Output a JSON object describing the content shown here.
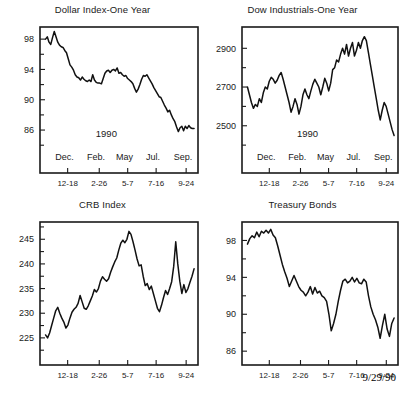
{
  "footer": {
    "date": "9/29/90"
  },
  "panels": [
    {
      "id": "dollar-index",
      "title": "Dollar Index-One Year",
      "year_label": "1990"
    },
    {
      "id": "dow-industrials",
      "title": "Dow Industrials-One Year",
      "year_label": "1990"
    },
    {
      "id": "crb-index",
      "title": "CRB Index",
      "year_label": ""
    },
    {
      "id": "treasury-bonds",
      "title": "Treasury Bonds",
      "year_label": ""
    }
  ],
  "chart_data": [
    {
      "type": "line",
      "id": "dollar-index",
      "title": "Dollar Index-One Year",
      "xlabel": "",
      "ylabel": "",
      "annotation": "1990",
      "grid": false,
      "legend": null,
      "ylim": [
        83.5,
        99.6
      ],
      "yticks": [
        86,
        90,
        94,
        98
      ],
      "yticks_minor": [
        84,
        88,
        92,
        96
      ],
      "ytick_labels": [
        "86",
        "90",
        "94",
        "98"
      ],
      "xtick_labels": [
        "12-18",
        "2-26",
        "5-7",
        "7-16",
        "9-24"
      ],
      "xtick_positions": [
        0.175,
        0.375,
        0.555,
        0.735,
        0.925
      ],
      "month_labels": [
        "Dec.",
        "Feb.",
        "May",
        "Jul.",
        "Sep."
      ],
      "month_positions": [
        0.155,
        0.355,
        0.535,
        0.715,
        0.905
      ],
      "values": [
        98.0,
        98.3,
        97.6,
        97.3,
        98.2,
        99.0,
        98.3,
        97.6,
        97.2,
        97.0,
        96.9,
        96.5,
        96.2,
        95.4,
        94.6,
        94.3,
        93.9,
        93.3,
        93.0,
        92.9,
        92.6,
        93.0,
        92.7,
        92.5,
        92.4,
        92.6,
        92.4,
        93.3,
        92.6,
        92.3,
        92.2,
        92.2,
        92.1,
        92.8,
        93.5,
        93.8,
        93.9,
        93.6,
        93.9,
        94.0,
        93.8,
        94.2,
        93.5,
        93.6,
        93.3,
        93.1,
        93.2,
        92.8,
        92.6,
        92.4,
        92.1,
        91.5,
        91.0,
        91.4,
        92.0,
        92.7,
        93.2,
        93.1,
        93.3,
        92.9,
        92.5,
        92.1,
        91.6,
        91.2,
        90.8,
        90.4,
        90.3,
        89.8,
        89.3,
        88.9,
        88.4,
        88.6,
        88.0,
        87.5,
        87.1,
        86.4,
        85.8,
        86.3,
        86.5,
        85.9,
        86.5,
        86.2,
        86.6,
        86.3,
        86.2,
        86.2
      ]
    },
    {
      "type": "line",
      "id": "dow-industrials",
      "title": "Dow Industrials-One Year",
      "xlabel": "",
      "ylabel": "",
      "annotation": "1990",
      "grid": false,
      "legend": null,
      "ylim": [
        2380,
        3010
      ],
      "yticks": [
        2500,
        2700,
        2900
      ],
      "yticks_minor": [
        2400,
        2600,
        2800,
        3000
      ],
      "ytick_labels": [
        "2500",
        "2700",
        "2900"
      ],
      "xtick_labels": [
        "12-18",
        "2-26",
        "5-7",
        "7-16",
        "9-24"
      ],
      "xtick_positions": [
        0.175,
        0.375,
        0.555,
        0.735,
        0.925
      ],
      "month_labels": [
        "Dec.",
        "Feb.",
        "May",
        "Jul.",
        "Sep."
      ],
      "month_positions": [
        0.155,
        0.355,
        0.535,
        0.715,
        0.905
      ],
      "values": [
        2700,
        2660,
        2620,
        2590,
        2610,
        2600,
        2640,
        2620,
        2670,
        2700,
        2690,
        2730,
        2750,
        2740,
        2720,
        2735,
        2760,
        2775,
        2740,
        2700,
        2660,
        2620,
        2570,
        2600,
        2640,
        2610,
        2560,
        2600,
        2660,
        2690,
        2660,
        2640,
        2680,
        2715,
        2740,
        2720,
        2700,
        2660,
        2700,
        2745,
        2720,
        2680,
        2720,
        2790,
        2800,
        2840,
        2830,
        2870,
        2900,
        2870,
        2920,
        2860,
        2900,
        2930,
        2860,
        2890,
        2930,
        2900,
        2940,
        2960,
        2940,
        2880,
        2820,
        2760,
        2700,
        2640,
        2580,
        2530,
        2580,
        2620,
        2600,
        2560,
        2520,
        2480,
        2450
      ]
    },
    {
      "type": "line",
      "id": "crb-index",
      "title": "CRB Index",
      "xlabel": "",
      "ylabel": "",
      "annotation": "",
      "grid": false,
      "legend": null,
      "ylim": [
        219.5,
        248.5
      ],
      "yticks": [
        225,
        230,
        235,
        240,
        245
      ],
      "yticks_minor": [
        222.5,
        227.5,
        232.5,
        237.5,
        242.5,
        247.5
      ],
      "ytick_labels": [
        "225",
        "230",
        "235",
        "240",
        "245"
      ],
      "xtick_labels": [
        "12-18",
        "2-26",
        "5-7",
        "7-16",
        "9-24"
      ],
      "xtick_positions": [
        0.175,
        0.375,
        0.555,
        0.735,
        0.925
      ],
      "month_labels": [],
      "month_positions": [],
      "values": [
        225.6,
        225.0,
        226.0,
        227.5,
        229.0,
        230.5,
        231.2,
        230.0,
        229.0,
        228.2,
        227.0,
        227.6,
        229.0,
        230.2,
        230.8,
        231.2,
        232.0,
        233.6,
        232.3,
        231.0,
        230.8,
        231.5,
        232.5,
        233.5,
        234.8,
        234.3,
        235.0,
        236.5,
        237.4,
        236.9,
        236.5,
        237.0,
        238.3,
        239.4,
        240.4,
        241.2,
        242.8,
        244.2,
        244.8,
        244.3,
        245.0,
        246.6,
        246.0,
        244.5,
        242.8,
        241.0,
        239.6,
        239.8,
        237.5,
        235.6,
        236.0,
        234.8,
        235.5,
        234.0,
        232.5,
        231.0,
        230.3,
        231.6,
        233.2,
        234.6,
        233.8,
        235.0,
        236.4,
        239.5,
        244.5,
        240.0,
        236.5,
        234.0,
        235.8,
        234.2,
        235.0,
        236.3,
        237.5,
        239.0
      ]
    },
    {
      "type": "line",
      "id": "treasury-bonds",
      "title": "Treasury Bonds",
      "xlabel": "",
      "ylabel": "",
      "annotation": "",
      "grid": false,
      "legend": null,
      "ylim": [
        84.5,
        100.0
      ],
      "yticks": [
        86,
        90,
        94,
        98
      ],
      "yticks_minor": [
        88,
        92,
        96
      ],
      "ytick_labels": [
        "86",
        "90",
        "94",
        "98"
      ],
      "xtick_labels": [
        "12-18",
        "2-26",
        "5-7",
        "7-16",
        "9-24"
      ],
      "xtick_positions": [
        0.175,
        0.375,
        0.555,
        0.735,
        0.925
      ],
      "month_labels": [],
      "month_positions": [],
      "values": [
        97.6,
        98.2,
        98.5,
        98.3,
        98.9,
        98.4,
        99.0,
        98.8,
        99.1,
        98.8,
        99.2,
        98.6,
        98.3,
        97.4,
        96.4,
        95.4,
        94.6,
        93.9,
        93.0,
        93.6,
        94.2,
        93.6,
        93.0,
        92.6,
        92.4,
        92.0,
        92.4,
        93.0,
        92.2,
        92.9,
        92.3,
        92.5,
        92.0,
        91.8,
        91.4,
        90.0,
        88.2,
        89.0,
        90.0,
        91.4,
        92.6,
        93.6,
        93.8,
        93.4,
        93.6,
        94.0,
        93.5,
        93.9,
        93.4,
        93.3,
        93.8,
        93.5,
        92.0,
        90.8,
        90.0,
        89.4,
        88.6,
        87.4,
        88.8,
        90.0,
        88.4,
        87.6,
        89.0,
        89.6
      ]
    }
  ]
}
